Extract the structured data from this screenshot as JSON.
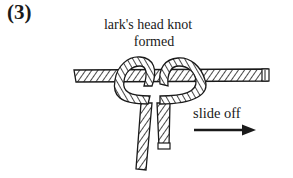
{
  "figure": {
    "step_label": "(3)",
    "caption": {
      "line1": "lark's head knot",
      "line2": "formed"
    },
    "annotation": {
      "text": "slide off",
      "arrow_direction": "right"
    },
    "illustration": "rope-larks-head-knot-on-horizontal-rope",
    "colors": {
      "ink": "#1a1a1a",
      "background": "#ffffff"
    }
  }
}
